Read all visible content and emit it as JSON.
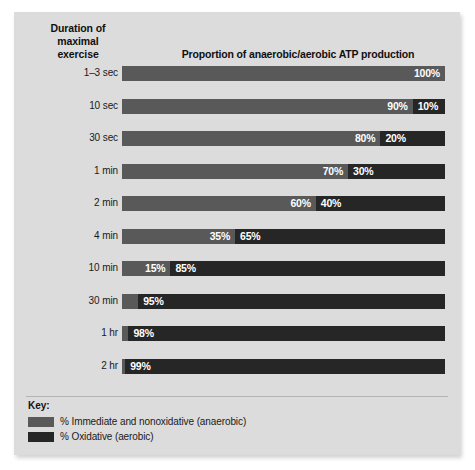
{
  "header": {
    "row_axis_title": "Duration of\nmaximal\nexercise",
    "chart_title": "Proportion of anaerobic/aerobic ATP production"
  },
  "key": {
    "title": "Key:",
    "items": [
      {
        "label": "% Immediate and nonoxidative (anaerobic)",
        "color": "#595959"
      },
      {
        "label": "% Oxidative (aerobic)",
        "color": "#262626"
      }
    ]
  },
  "chart_data": {
    "type": "bar",
    "subtype": "stacked-horizontal-100pct",
    "title": "Proportion of anaerobic/aerobic ATP production",
    "xlabel": "",
    "ylabel": "Duration of maximal exercise",
    "xlim": [
      0,
      100
    ],
    "grid": false,
    "legend_position": "bottom-left",
    "categories": [
      "1–3 sec",
      "10 sec",
      "30 sec",
      "1 min",
      "2 min",
      "4 min",
      "10 min",
      "30 min",
      "1 hr",
      "2 hr"
    ],
    "series": [
      {
        "name": "% Immediate and nonoxidative (anaerobic)",
        "color": "#595959",
        "values": [
          100,
          90,
          80,
          70,
          60,
          35,
          15,
          5,
          2,
          1
        ]
      },
      {
        "name": "% Oxidative (aerobic)",
        "color": "#262626",
        "values": [
          0,
          10,
          20,
          30,
          40,
          65,
          85,
          95,
          98,
          99
        ]
      }
    ],
    "data_labels": {
      "anaerobic": [
        "100%",
        "90%",
        "80%",
        "70%",
        "60%",
        "35%",
        "15%",
        "5%",
        "2%",
        "1%"
      ],
      "aerobic": [
        "",
        "10%",
        "20%",
        "30%",
        "40%",
        "65%",
        "85%",
        "95%",
        "98%",
        "99%"
      ]
    },
    "callout_rows": [
      "30 min",
      "1 hr",
      "2 hr"
    ]
  },
  "rows": [
    {
      "label": "1–3 sec",
      "an": 100,
      "ae": 0,
      "an_label": "100%",
      "ae_label": "",
      "callout": false
    },
    {
      "label": "10 sec",
      "an": 90,
      "ae": 10,
      "an_label": "90%",
      "ae_label": "10%",
      "callout": false
    },
    {
      "label": "30 sec",
      "an": 80,
      "ae": 20,
      "an_label": "80%",
      "ae_label": "20%",
      "callout": false
    },
    {
      "label": "1 min",
      "an": 70,
      "ae": 30,
      "an_label": "70%",
      "ae_label": "30%",
      "callout": false
    },
    {
      "label": "2 min",
      "an": 60,
      "ae": 40,
      "an_label": "60%",
      "ae_label": "40%",
      "callout": false
    },
    {
      "label": "4 min",
      "an": 35,
      "ae": 65,
      "an_label": "35%",
      "ae_label": "65%",
      "callout": false
    },
    {
      "label": "10 min",
      "an": 15,
      "ae": 85,
      "an_label": "15%",
      "ae_label": "85%",
      "callout": false
    },
    {
      "label": "30 min",
      "an": 5,
      "ae": 95,
      "an_label": "5%",
      "ae_label": "95%",
      "callout": true
    },
    {
      "label": "1 hr",
      "an": 2,
      "ae": 98,
      "an_label": "2%",
      "ae_label": "98%",
      "callout": true
    },
    {
      "label": "2 hr",
      "an": 1,
      "ae": 99,
      "an_label": "1%",
      "ae_label": "99%",
      "callout": true
    }
  ]
}
